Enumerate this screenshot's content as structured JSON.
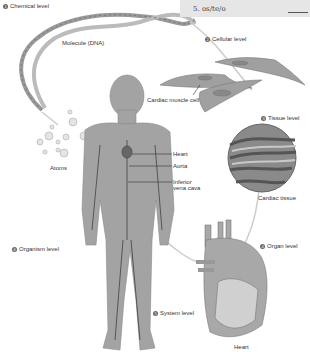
{
  "quiz_box": {
    "item": "5. os/te/o"
  },
  "levels": [
    {
      "number": "1",
      "label": "Chemical level"
    },
    {
      "number": "2",
      "label": "Cellular level"
    },
    {
      "number": "3",
      "label": "Tissue level"
    },
    {
      "number": "4",
      "label": "Organ level"
    },
    {
      "number": "5",
      "label": "System level"
    },
    {
      "number": "6",
      "label": "Organism level"
    }
  ],
  "structure_labels": {
    "molecule": "Molecule (DNA)",
    "atoms": "Atoms",
    "cardiac_muscle_cell": "Cardiac muscle cell",
    "cardiac_tissue": "Cardiac tissue",
    "heart_organ": "Heart",
    "heart": "Heart",
    "aorta": "Aorta",
    "inferior_vena_cava": "Inferior vena cava"
  },
  "colors": {
    "figure_gray": "#9a9a9a",
    "dark": "#555555",
    "label_text": "#333333"
  }
}
